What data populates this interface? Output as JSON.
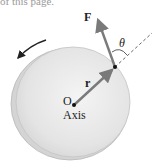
{
  "caption_fragment": "of this page.",
  "figure": {
    "labels": {
      "force": "F",
      "angle": "θ",
      "radius": "r",
      "origin": "O",
      "axis": "Axis"
    },
    "colors": {
      "disc_face": "#e6e6e6",
      "disc_rim": "#cfcfcf",
      "vector": "#7a7a7a",
      "ink": "#222222",
      "dashed": "#555555"
    },
    "rotation_direction": "counterclockwise"
  }
}
